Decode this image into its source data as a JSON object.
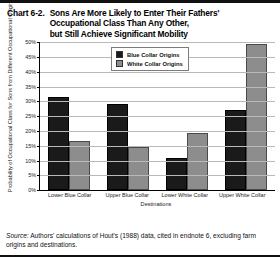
{
  "chart_number": "Chart 6-2.",
  "title_lines": [
    "Sons Are More Likely to Enter Their Fathers'",
    "Occupational Class Than Any Other,",
    "but Still Achieve Significant Mobility"
  ],
  "source": {
    "label": "Source:",
    "text": "Authors' calculations of Hout's (1988) data, cited in endnote 6, excluding farm origins and destinations."
  },
  "colors": {
    "blue_collar": "#1a1a1a",
    "white_collar": "#8d8d8d",
    "gridline": "#b9b9b9",
    "axis": "#000000",
    "background": "#ffffff"
  },
  "chart_data": {
    "type": "bar",
    "title": "Sons Are More Likely to Enter Their Fathers' Occupational Class Than Any Other, but Still Achieve Significant Mobility",
    "xlabel": "Destinations",
    "ylabel": "Probability of Occupational Class for Sons from Different Occupational Origins",
    "categories": [
      "Lower Blue Collar",
      "Upper Blue Collar",
      "Lower White Collar",
      "Upper White Collar"
    ],
    "series": [
      {
        "name": "Blue Collar Origins",
        "color": "#1a1a1a",
        "values": [
          31.5,
          29.0,
          11.0,
          27.0
        ]
      },
      {
        "name": "White Collar Origins",
        "color": "#8d8d8d",
        "values": [
          16.5,
          14.5,
          19.5,
          49.5
        ]
      }
    ],
    "ylim": [
      0,
      50
    ],
    "yticks": [
      0,
      5,
      10,
      15,
      20,
      25,
      30,
      35,
      40,
      45,
      50
    ],
    "ytick_labels": [
      "0%",
      "5%",
      "10%",
      "15%",
      "20%",
      "25%",
      "30%",
      "35%",
      "40%",
      "45%",
      "50%"
    ],
    "grid": true,
    "legend_position": "top-right",
    "value_unit": "percent"
  }
}
